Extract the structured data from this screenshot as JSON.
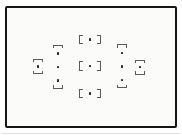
{
  "figure": {
    "name": "camera-viewfinder-af-point-diagram",
    "text_content": ""
  },
  "colors": {
    "page_bg": "#ffffff",
    "frame_border": "#161616",
    "frame_fill": "#fbfbfa",
    "dot": "#2d2d2d",
    "bracket": "#5a5a5a",
    "edge_shadow": "#c9c9c3"
  },
  "frame": {
    "x": 4.5,
    "y": 5.5,
    "width": 172,
    "height": 122
  },
  "edge_shadow": {
    "x": 2,
    "y": 132.5,
    "width": 178
  },
  "af_points": {
    "bracketed": [
      {
        "id": "af-point-top-center",
        "x": 90,
        "y": 39.5
      },
      {
        "id": "af-point-center",
        "x": 90,
        "y": 66
      },
      {
        "id": "af-point-bottom-center",
        "x": 90,
        "y": 93.5
      }
    ],
    "plain_dots": [
      {
        "id": "af-dot-left-column-top",
        "x": 58,
        "y": 53.5
      },
      {
        "id": "af-dot-left-column-middle",
        "x": 58,
        "y": 67
      },
      {
        "id": "af-dot-left-column-bottom",
        "x": 58,
        "y": 80.5
      },
      {
        "id": "af-dot-right-column-top",
        "x": 122,
        "y": 53
      },
      {
        "id": "af-dot-right-column-middle",
        "x": 122,
        "y": 66.5
      },
      {
        "id": "af-dot-right-column-bottom",
        "x": 122,
        "y": 80
      },
      {
        "id": "af-dot-far-left",
        "x": 38,
        "y": 66.5
      },
      {
        "id": "af-dot-far-right",
        "x": 140,
        "y": 67
      }
    ],
    "caps": [
      {
        "id": "left-column-top-cap",
        "x": 58,
        "y": 46.5,
        "open": "down"
      },
      {
        "id": "left-column-bottom-cap",
        "x": 58,
        "y": 87,
        "open": "up"
      },
      {
        "id": "right-column-top-cap",
        "x": 122,
        "y": 46,
        "open": "down"
      },
      {
        "id": "right-column-bottom-cap",
        "x": 122,
        "y": 86.5,
        "open": "up"
      },
      {
        "id": "far-left-top-cap",
        "x": 38,
        "y": 60.5,
        "open": "down"
      },
      {
        "id": "far-left-bottom-cap",
        "x": 38,
        "y": 72.5,
        "open": "up"
      },
      {
        "id": "far-right-top-cap",
        "x": 140,
        "y": 61.5,
        "open": "down"
      },
      {
        "id": "far-right-bottom-cap",
        "x": 140,
        "y": 73,
        "open": "up"
      }
    ]
  }
}
